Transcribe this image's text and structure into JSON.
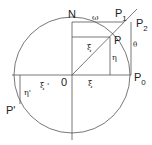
{
  "diagram": {
    "type": "geometric-construction",
    "labels": {
      "N": "N",
      "O": "0",
      "P": "P",
      "P0": "P",
      "P0_sub": "0",
      "P1": "P",
      "P1_sub": "1",
      "P2": "P",
      "P2_sub": "2",
      "P_prime": "P'",
      "omega": "ω",
      "xi_upper": "ξ",
      "xi_lower": "ξ",
      "eta": "η",
      "xi_prime": "ξ '",
      "eta_prime": "η'",
      "theta": "θ"
    },
    "colors": {
      "line": "#555555",
      "text": "#222222",
      "background": "#ffffff"
    }
  }
}
